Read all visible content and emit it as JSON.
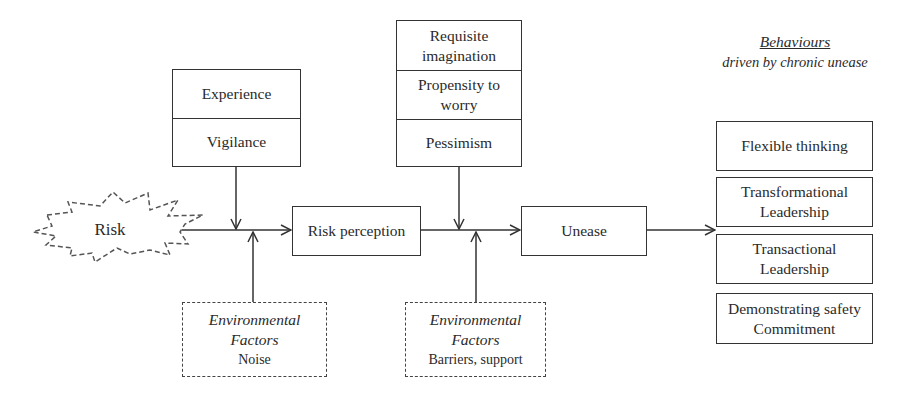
{
  "diagram": {
    "source": {
      "label": "Risk",
      "shape": "starburst-dashed"
    },
    "antecedents_1": {
      "items": [
        "Experience",
        "Vigilance"
      ]
    },
    "antecedents_2": {
      "items": [
        "Requisite imagination",
        "Propensity to worry",
        "Pessimism"
      ]
    },
    "risk_perception": {
      "label": "Risk perception"
    },
    "unease": {
      "label": "Unease"
    },
    "environment_1": {
      "title_line1": "Environmental",
      "title_line2": "Factors",
      "detail": "Noise"
    },
    "environment_2": {
      "title_line1": "Environmental",
      "title_line2": "Factors",
      "detail": "Barriers, support"
    },
    "behaviours": {
      "heading": "Behaviours",
      "subheading": "driven by chronic unease",
      "items": [
        {
          "line1": "Flexible thinking",
          "line2": ""
        },
        {
          "line1": "Transformational",
          "line2": "Leadership"
        },
        {
          "line1": "Transactional",
          "line2": "Leadership"
        },
        {
          "line1": "Demonstrating safety",
          "line2": "Commitment"
        }
      ]
    },
    "colors": {
      "line": "#333333",
      "text": "#2a2a2a",
      "background": "#ffffff"
    }
  }
}
